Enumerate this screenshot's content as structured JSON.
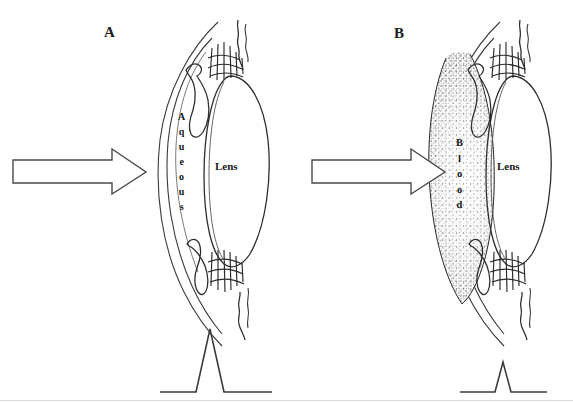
{
  "figure": {
    "width": 573,
    "height": 402,
    "background_color": "#ffffff",
    "ink_color": "#2a2a2a",
    "type": "line-drawing-diagram"
  },
  "panels": [
    {
      "id": "A",
      "label": "A",
      "label_x": 110,
      "label_y": 32,
      "chamber_label": "Aqueous",
      "chamber_letters": [
        "A",
        "q",
        "u",
        "e",
        "o",
        "u",
        "s"
      ],
      "chamber_fill": "clear",
      "lens_label": "Lens",
      "arrow_label": "incident-beam-arrow",
      "trace_peak_height_px": 63,
      "trace_description": "tall narrow peak on flat baseline"
    },
    {
      "id": "B",
      "label": "B",
      "label_x": 400,
      "label_y": 33,
      "chamber_label": "Blood",
      "chamber_letters": [
        "B",
        "l",
        "o",
        "o",
        "d"
      ],
      "chamber_fill": "stippled",
      "lens_label": "Lens",
      "arrow_label": "incident-beam-arrow",
      "trace_peak_height_px": 30,
      "trace_description": "short attenuated peak on flat baseline"
    }
  ],
  "chart_data": {
    "type": "line",
    "title": "",
    "xlabel": "",
    "ylabel": "",
    "grid": false,
    "legend": "none",
    "series": [
      {
        "name": "A",
        "x": [
          160,
          196,
          210,
          224,
          272
        ],
        "values": [
          0,
          0,
          63,
          0,
          0
        ]
      },
      {
        "name": "B",
        "x": [
          460,
          495,
          503,
          511,
          547
        ],
        "values": [
          0,
          0,
          30,
          0,
          0
        ]
      }
    ],
    "ylim": [
      0,
      70
    ],
    "baseline": 0
  }
}
